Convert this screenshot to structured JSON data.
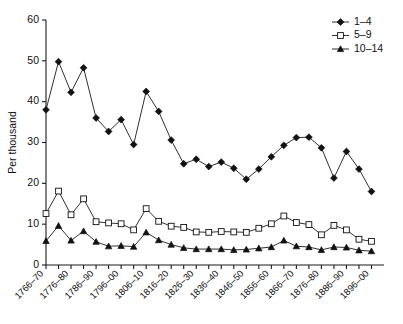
{
  "chart_data": {
    "type": "line",
    "title": "",
    "xlabel": "",
    "ylabel": "Per thousand",
    "ylim": [
      0,
      60
    ],
    "yticks": [
      0,
      10,
      20,
      30,
      40,
      50,
      60
    ],
    "grid": false,
    "legend_position": "top-right",
    "x": [
      "1766-70",
      "1771-75",
      "1776-80",
      "1781-85",
      "1786-90",
      "1791-95",
      "1796-00",
      "1801-05",
      "1806-10",
      "1811-15",
      "1816-20",
      "1821-25",
      "1826-30",
      "1831-35",
      "1836-40",
      "1841-45",
      "1846-50",
      "1851-55",
      "1856-60",
      "1861-65",
      "1866-70",
      "1871-75",
      "1876-80",
      "1881-85",
      "1886-90",
      "1891-95",
      "1896-00"
    ],
    "xtick_labels_shown": [
      "1766-70",
      "1776-80",
      "1786-90",
      "1796-00",
      "1806-10",
      "1816-20",
      "1826-30",
      "1836-40",
      "1846-50",
      "1856-60",
      "1866-70",
      "1876-80",
      "1886-90"
    ],
    "series": [
      {
        "name": "1-4",
        "marker": "filled-diamond",
        "values": [
          38.0,
          49.8,
          42.3,
          48.3,
          36.0,
          32.7,
          35.6,
          29.5,
          42.5,
          37.6,
          30.6,
          24.8,
          25.9,
          24.1,
          25.2,
          23.7,
          21.0,
          23.5,
          26.5,
          29.3,
          31.2,
          31.3,
          28.7,
          21.3,
          27.8,
          23.5,
          18.0
        ]
      },
      {
        "name": "5-9",
        "marker": "open-square",
        "values": [
          12.6,
          18.1,
          12.3,
          16.2,
          10.6,
          10.3,
          10.1,
          8.6,
          13.8,
          10.7,
          9.5,
          9.2,
          8.1,
          8.0,
          8.2,
          8.1,
          8.0,
          9.0,
          10.1,
          12.0,
          10.4,
          9.9,
          7.4,
          9.7,
          8.6,
          6.3,
          5.8
        ]
      },
      {
        "name": "10-14",
        "marker": "filled-triangle",
        "values": [
          5.9,
          9.6,
          6.0,
          8.3,
          5.7,
          4.6,
          4.7,
          4.5,
          8.0,
          6.1,
          5.0,
          4.2,
          3.9,
          3.9,
          3.9,
          3.7,
          3.8,
          4.1,
          4.4,
          6.0,
          4.6,
          4.4,
          3.7,
          4.4,
          4.3,
          3.6,
          3.4
        ]
      }
    ]
  },
  "legend": {
    "items": [
      {
        "label": "1-4"
      },
      {
        "label": "5-9"
      },
      {
        "label": "10-14"
      }
    ]
  },
  "axes": {
    "y_title": "Per thousand"
  },
  "colors": {
    "ink": "#111111",
    "background": "#ffffff"
  }
}
